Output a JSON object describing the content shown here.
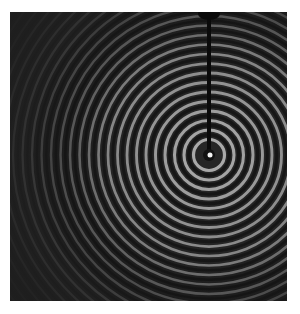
{
  "image": {
    "subject": "Concentric water ripples spreading from a vertical probe in a ripple tank",
    "background_color": "#262626",
    "ring_color_light": "#bdbdbd",
    "ring_color_dark": "#141414",
    "ripple_center": {
      "x": 199,
      "y": 143
    },
    "ring_spacing_px": 9.5,
    "ring_count": 30,
    "probe": {
      "x": 199,
      "top": 0,
      "bottom": 140,
      "width": 4,
      "color": "#0a0a0a"
    }
  }
}
